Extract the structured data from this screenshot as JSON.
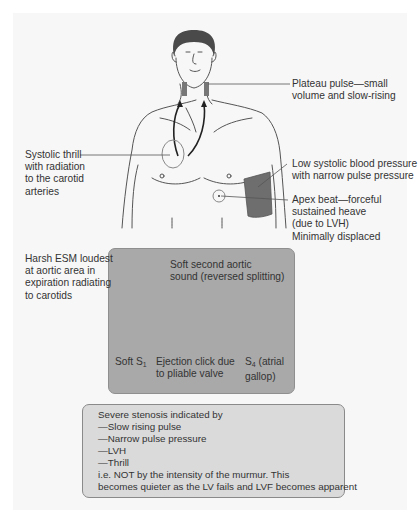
{
  "labels": {
    "plateau_pulse": [
      "Plateau pulse—small",
      "volume and slow-rising"
    ],
    "systolic_thrill": [
      "Systolic thrill",
      "with radiation",
      "to the carotid",
      "arteries"
    ],
    "low_bp": [
      "Low systolic blood pressure",
      "with narrow pulse pressure"
    ],
    "apex_beat": [
      "Apex beat—forceful",
      "sustained heave",
      "(due to LVH)",
      "Minimally displaced"
    ],
    "harsh_esm": [
      "Harsh ESM loudest",
      "at aortic area in",
      "expiration radiating",
      "to carotids"
    ]
  },
  "phonocardiogram": {
    "soft_a2": [
      "Soft second aortic",
      "sound (reversed splitting)"
    ],
    "soft_s1": "Soft S",
    "soft_s1_sub": "1",
    "ejection_click": [
      "Ejection click due",
      "to pliable valve"
    ],
    "s4": "S",
    "s4_sub": "4",
    "s4_suffix": " (atrial",
    "s4_line2": "gallop)"
  },
  "severe_box": {
    "lines": [
      "Severe stenosis indicated by",
      "—Slow rising pulse",
      "—Narrow pulse pressure",
      "—LVH",
      "—Thrill",
      "i.e. NOT by the intensity of the murmur. This",
      "becomes quieter as the LV fails and LVF becomes apparent"
    ]
  },
  "colors": {
    "panel_bg": "#f7f7f7",
    "murmur_box_bg": "#a9a9a9",
    "severe_box_bg": "#dadada",
    "cuff": "#6e6e6e",
    "hair": "#4a4a4a"
  }
}
